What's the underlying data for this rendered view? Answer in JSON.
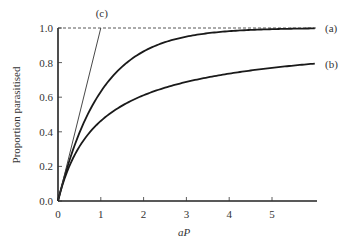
{
  "chart_data": {
    "type": "line",
    "title": "",
    "xlabel": "aP",
    "ylabel": "Proportion parasitised",
    "xlim": [
      0,
      6
    ],
    "ylim": [
      0,
      1.0
    ],
    "xticks": [
      "0",
      "1",
      "2",
      "3",
      "4",
      "5"
    ],
    "xtick_values": [
      0,
      1,
      2,
      3,
      4,
      5
    ],
    "yticks": [
      "0.0",
      "0.2",
      "0.4",
      "0.6",
      "0.8",
      "1.0"
    ],
    "ytick_values": [
      0,
      0.2,
      0.4,
      0.6,
      0.8,
      1.0
    ],
    "grid": false,
    "reference_line": {
      "y": 1.0,
      "style": "dashed"
    },
    "series": [
      {
        "name": "(a)",
        "description": "1 - exp(-aP)",
        "x": [
          0,
          0.25,
          0.5,
          0.75,
          1,
          1.5,
          2,
          2.5,
          3,
          3.5,
          4,
          4.5,
          5,
          5.5,
          6
        ],
        "y": [
          0,
          0.221,
          0.393,
          0.528,
          0.632,
          0.777,
          0.865,
          0.918,
          0.95,
          0.97,
          0.982,
          0.989,
          0.993,
          0.996,
          0.998
        ]
      },
      {
        "name": "(b)",
        "description": "1 - (1 + aP/k)^-k, k≈0.7",
        "x": [
          0,
          0.25,
          0.5,
          0.75,
          1,
          1.5,
          2,
          2.5,
          3,
          3.5,
          4,
          4.5,
          5,
          5.5,
          6
        ],
        "y": [
          0,
          0.188,
          0.302,
          0.39,
          0.463,
          0.551,
          0.611,
          0.656,
          0.69,
          0.718,
          0.742,
          0.761,
          0.778,
          0.793,
          0.794
        ]
      },
      {
        "name": "(c)",
        "description": "aP (linear, no saturation)",
        "x": [
          0,
          1
        ],
        "y": [
          0,
          1.0
        ]
      }
    ]
  }
}
